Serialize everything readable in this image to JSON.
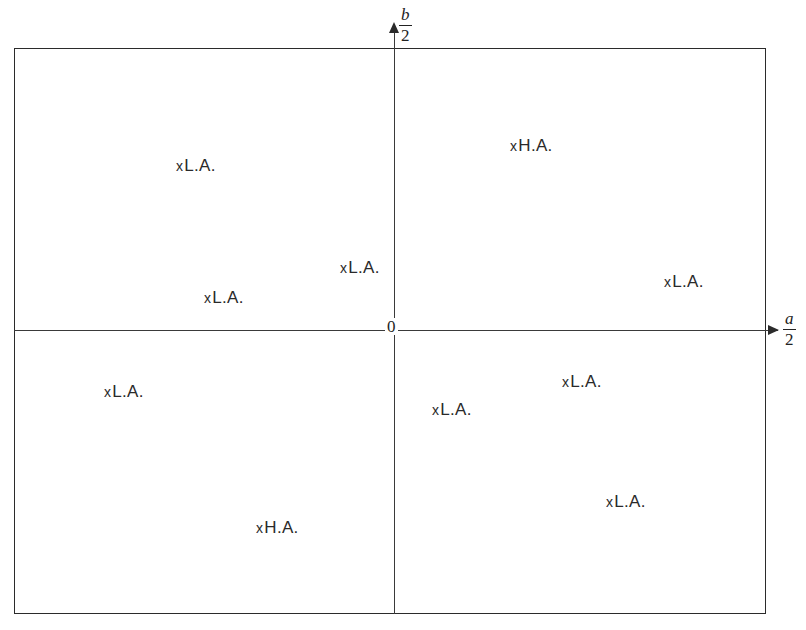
{
  "figure": {
    "background_color": "#ffffff",
    "line_color": "#2b2b2b",
    "width": 806,
    "height": 630
  },
  "axes": {
    "horizontal": {
      "name": "a-over-2-axis",
      "numerator": "a",
      "divider": "/",
      "denominator": "2",
      "arrow": "right-arrow"
    },
    "vertical": {
      "name": "b-over-2-axis",
      "numerator": "b",
      "divider": "/",
      "denominator": "2",
      "arrow": "up-arrow"
    },
    "origin_label": "0"
  },
  "chart_data": {
    "type": "scatter",
    "title": "",
    "subtitle": "",
    "xlabel": "a/2",
    "ylabel": "b/2",
    "grid": false,
    "legend": "none",
    "axis_origin_label": "0",
    "xlim": [
      -380,
      384
    ],
    "ylim": [
      -284,
      282
    ],
    "marker": "x",
    "categories": [
      "L.A.",
      "H.A."
    ],
    "note": "Coordinates are in pixel-space relative to the origin at (394,330); quadrant signs indicate placement.",
    "points": [
      {
        "label": "L.A.",
        "marker": "x",
        "x": -218,
        "y": 174,
        "quadrant": "upper-left",
        "px": 176,
        "py": 156
      },
      {
        "label": "H.A.",
        "marker": "x",
        "x": 116,
        "y": 194,
        "quadrant": "upper-right",
        "px": 510,
        "py": 136
      },
      {
        "label": "L.A.",
        "marker": "x",
        "x": -54,
        "y": 72,
        "quadrant": "upper-left",
        "px": 340,
        "py": 258
      },
      {
        "label": "L.A.",
        "marker": "x",
        "x": 270,
        "y": 58,
        "quadrant": "upper-right",
        "px": 664,
        "py": 272
      },
      {
        "label": "L.A.",
        "marker": "x",
        "x": -190,
        "y": 42,
        "quadrant": "upper-left",
        "px": 204,
        "py": 288
      },
      {
        "label": "L.A.",
        "marker": "x",
        "x": 168,
        "y": -42,
        "quadrant": "lower-right",
        "px": 562,
        "py": 372
      },
      {
        "label": "L.A.",
        "marker": "x",
        "x": -290,
        "y": -52,
        "quadrant": "lower-left",
        "px": 104,
        "py": 382
      },
      {
        "label": "L.A.",
        "marker": "x",
        "x": 38,
        "y": -70,
        "quadrant": "lower-right",
        "px": 432,
        "py": 400
      },
      {
        "label": "L.A.",
        "marker": "x",
        "x": 212,
        "y": -162,
        "quadrant": "lower-right",
        "px": 606,
        "py": 492
      },
      {
        "label": "H.A.",
        "marker": "x",
        "x": -138,
        "y": -188,
        "quadrant": "lower-left",
        "px": 256,
        "py": 518
      }
    ]
  }
}
